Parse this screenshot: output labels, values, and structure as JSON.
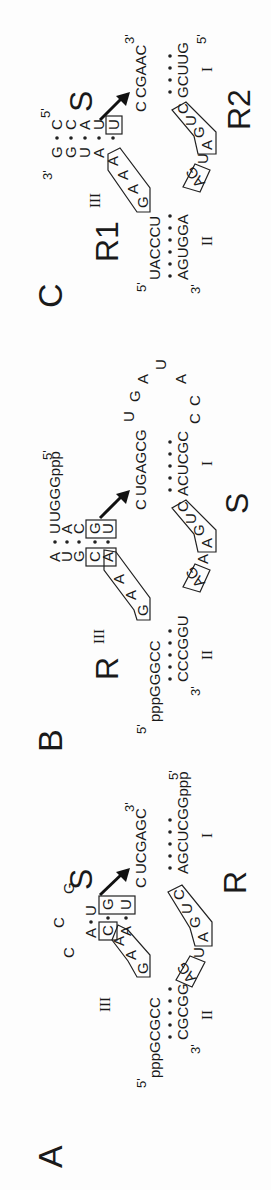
{
  "figure": {
    "orientation": "rotated -90deg (reads bottom-to-top)",
    "panels": [
      {
        "label": "A",
        "strand_labels": {
          "substrate": "S",
          "ribozyme": "R"
        },
        "helix_labels": [
          "I",
          "II",
          "III"
        ],
        "ribozyme_5prime": "5'",
        "ribozyme_5prime_seq": "pppGCGCC",
        "ribozyme_3prime_arm": "CGCGG",
        "ribozyme_3prime": "3'",
        "substrate_3prime": "3'",
        "substrate_stem_top": "UCGAGC",
        "substrate_stem_bottom": "AGCUCGGppp",
        "substrate_5prime": "5'",
        "core_boxes": [
          "GAA",
          "CA",
          "GU",
          "AG",
          "AGUC"
        ],
        "loop_III": [
          "C",
          "C",
          "G"
        ],
        "helix_III_left": [
          "A",
          "C",
          "A"
        ],
        "helix_III_right": [
          "U",
          "G",
          "U"
        ],
        "cleavage_site": "C",
        "linker": "U"
      },
      {
        "label": "B",
        "strand_labels": {
          "ribozyme": "R",
          "substrate": "S"
        },
        "helix_labels": [
          "I",
          "II",
          "III"
        ],
        "ribozyme_5prime": "5'",
        "ribozyme_5prime_seq": "pppGGGCC",
        "helix_II_bottom": "CCCGGU",
        "helix_II_3prime": "3'",
        "helix_III_left": [
          "A",
          "U",
          "G",
          "C",
          "A"
        ],
        "helix_III_right": [
          "U",
          "A",
          "C",
          "G",
          "U"
        ],
        "helix_III_top_tail": "UGGGppp",
        "helix_III_top_5prime": "5'",
        "core_boxes": [
          "GAA",
          "CA",
          "GU",
          "AG",
          "AGUC"
        ],
        "cleavage_site": "C",
        "helix_I_top": "UGAGCG",
        "helix_I_bottom": "ACUCGC",
        "loop_I": [
          "U",
          "G",
          "A",
          "U",
          "A",
          "C",
          "C"
        ],
        "linker": "A"
      },
      {
        "label": "C",
        "strand_labels": {
          "ribozyme1": "R1",
          "substrate": "S",
          "ribozyme2": "R2"
        },
        "helix_labels": [
          "I",
          "II",
          "III"
        ],
        "r1_5prime": "5'",
        "r1_seq": "UACCCU",
        "r2_3prime": "3'",
        "r2_seq": "AGUGGA",
        "substrate_3prime_top": "3'",
        "substrate_5prime_top": "5'",
        "helix_III_left": [
          "G",
          "G",
          "U",
          "A"
        ],
        "helix_III_right": [
          "C",
          "C",
          "A",
          "U"
        ],
        "core_boxes": [
          "GAAA",
          "U",
          "AG",
          "AGUC"
        ],
        "cleavage_site": "C",
        "helix_I_top": "CGAAC",
        "helix_I_bottom": "GCUUG",
        "helix_I_3prime": "3'",
        "helix_I_5prime": "5'",
        "linker": "U"
      }
    ]
  },
  "labels": {
    "A": "A",
    "B": "B",
    "C": "C",
    "S": "S",
    "R": "R",
    "R1": "R1",
    "R2": "R2",
    "I": "I",
    "II": "II",
    "III": "III",
    "p5": "5'",
    "p3": "3'"
  }
}
